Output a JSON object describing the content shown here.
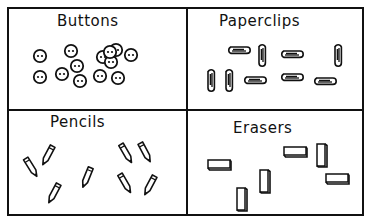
{
  "figure": {
    "cells": [
      {
        "title": "Buttons",
        "item": "button",
        "count": 13
      },
      {
        "title": "Paperclips",
        "item": "paperclip",
        "count": 9
      },
      {
        "title": "Pencils",
        "item": "pencil",
        "count": 8
      },
      {
        "title": "Erasers",
        "item": "eraser",
        "count": 6
      }
    ]
  }
}
